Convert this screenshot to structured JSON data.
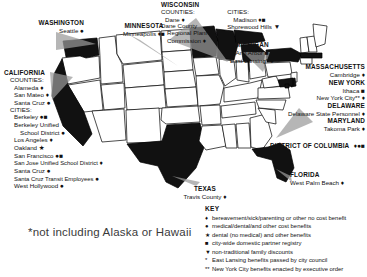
{
  "map": {
    "title_note": "*not including Alaska or Hawaii",
    "highlighted_states": [
      "Washington",
      "California",
      "Minnesota",
      "Wisconsin",
      "Michigan",
      "Texas",
      "Florida",
      "New York",
      "Massachusetts",
      "Delaware",
      "Maryland",
      "District of Columbia"
    ]
  },
  "regions": {
    "washington": {
      "state": "WASHINGTON",
      "entries": [
        {
          "name": "Seattle",
          "symbols": "●"
        }
      ]
    },
    "california": {
      "state": "CALIFORNIA",
      "counties_head": "COUNTIES:",
      "counties": [
        {
          "name": "Alameda",
          "symbols": "♦"
        },
        {
          "name": "San Mateo",
          "symbols": "♦"
        },
        {
          "name": "Santa Cruz",
          "symbols": "●"
        }
      ],
      "cities_head": "CITIES:",
      "cities": [
        {
          "name": "Berkeley",
          "symbols": "●■"
        },
        {
          "name": "Berkeley Unified",
          "symbols": ""
        },
        {
          "name": "School District",
          "symbols": "●"
        },
        {
          "name": "Los Angeles",
          "symbols": "♦"
        },
        {
          "name": "Oakland",
          "symbols": "★"
        },
        {
          "name": "San Francisco",
          "symbols": "●■"
        },
        {
          "name": "San Jose Unified School District",
          "symbols": "♦"
        },
        {
          "name": "Santa Cruz",
          "symbols": "●"
        },
        {
          "name": "Santa Cruz Transit Employees",
          "symbols": "●"
        },
        {
          "name": "West Hollywood",
          "symbols": "●"
        }
      ]
    },
    "minnesota": {
      "state": "MINNESOTA",
      "entries": [
        {
          "name": "Minneapolis",
          "symbols": "♦■"
        }
      ]
    },
    "wisconsin": {
      "state": "WISCONSIN",
      "counties_head": "COUNTIES:",
      "counties": [
        {
          "name": "Dane",
          "symbols": "♦"
        },
        {
          "name": "Dane County",
          "symbols": ""
        },
        {
          "name": "Regional Planning",
          "symbols": ""
        },
        {
          "name": "Commission",
          "symbols": "♦"
        }
      ],
      "cities_head": "CITIES:",
      "cities": [
        {
          "name": "Madison",
          "symbols": "♦■"
        },
        {
          "name": "Shorewood Hills",
          "symbols": "▼"
        }
      ]
    },
    "michigan": {
      "state": "MICHIGAN",
      "entries": [
        {
          "name": "Ann Arbor",
          "symbols": "■"
        },
        {
          "name": "East Lansing*",
          "symbols": "●"
        }
      ]
    },
    "massachusetts": {
      "state": "MASSACHUSETTS",
      "entries": [
        {
          "name": "Cambridge",
          "symbols": "♦"
        }
      ]
    },
    "new_york": {
      "state": "NEW YORK",
      "entries": [
        {
          "name": "Ithaca",
          "symbols": "■"
        },
        {
          "name": "New York City**",
          "symbols": "♦"
        }
      ]
    },
    "delaware": {
      "state": "DELAWARE",
      "entries": [
        {
          "name": "Delaware State Personnel",
          "symbols": "♦"
        }
      ]
    },
    "maryland": {
      "state": "MARYLAND",
      "entries": [
        {
          "name": "Takoma Park",
          "symbols": "♦"
        }
      ]
    },
    "dc": {
      "state": "DISTRICT OF COLUMBIA",
      "symbols": "♦●■"
    },
    "texas": {
      "state": "TEXAS",
      "entries": [
        {
          "name": "Travis County",
          "symbols": "♦"
        }
      ]
    },
    "florida": {
      "state": "FLORIDA",
      "entries": [
        {
          "name": "West Palm Beach",
          "symbols": "♦"
        }
      ]
    }
  },
  "key": {
    "title": "KEY",
    "rows": [
      {
        "symbol": "♦",
        "text": "bereavement/sick/parenting or other no cost benefit"
      },
      {
        "symbol": "●",
        "text": "medical/dental/and other cost benefits"
      },
      {
        "symbol": "★",
        "text": "dental (no medical) and other benefits"
      },
      {
        "symbol": "■",
        "text": "city-wide domestic partner registry"
      },
      {
        "symbol": "▼",
        "text": "non-traditional family discounts"
      },
      {
        "symbol": "*",
        "text": "East Lansing benefits passed by city council"
      },
      {
        "symbol": "**",
        "text": "New York City benefits enacted by executive order"
      }
    ]
  }
}
